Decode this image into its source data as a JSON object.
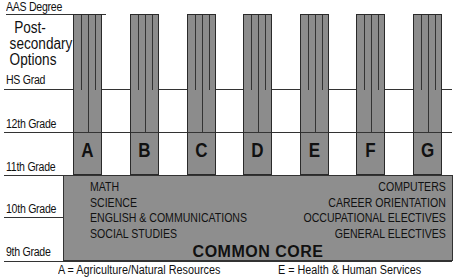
{
  "levels": [
    {
      "label": "AAS Degree",
      "y": 14
    },
    {
      "label": "HS Grad",
      "y": 89
    },
    {
      "label": "12th Grade",
      "y": 132
    },
    {
      "label": "11th Grade",
      "y": 175
    },
    {
      "label": "10th Grade",
      "y": 217
    },
    {
      "label": "9th Grade",
      "y": 260
    }
  ],
  "postsecondary_label": "Post-secondary Options",
  "clusters": [
    "A",
    "B",
    "C",
    "D",
    "E",
    "F",
    "G"
  ],
  "core": {
    "title": "COMMON CORE",
    "left_subjects": [
      "MATH",
      "SCIENCE",
      "ENGLISH & COMMUNICATIONS",
      "SOCIAL STUDIES"
    ],
    "right_subjects": [
      "COMPUTERS",
      "CAREER ORIENTATION",
      "OCCUPATIONAL ELECTIVES",
      "GENERAL ELECTIVES"
    ]
  },
  "legend": {
    "left": "A = Agriculture/Natural Resources",
    "right": "E = Health & Human Services"
  },
  "colors": {
    "fill": "#8c8c8c",
    "line": "#333333"
  }
}
